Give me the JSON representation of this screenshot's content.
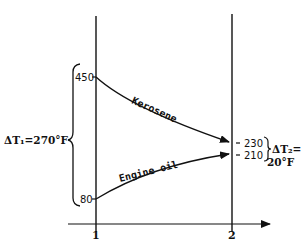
{
  "diagram": {
    "type": "temperature-profile",
    "axis": {
      "x_labels": [
        "1",
        "2"
      ]
    },
    "streams": [
      {
        "name": "Kerosene",
        "inlet_temp": "450",
        "outlet_temp": "230"
      },
      {
        "name": "Engine oil",
        "inlet_temp": "80",
        "outlet_temp": "210"
      }
    ],
    "delta_t1": {
      "label": "ΔT₁=270°F"
    },
    "delta_t2": {
      "label_line1": "ΔT₂=",
      "label_line2": "20°F"
    }
  }
}
